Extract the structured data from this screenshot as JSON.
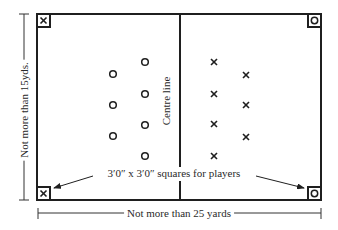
{
  "diagram": {
    "colors": {
      "line": "#1f1f1f",
      "text": "#2a2a2a",
      "background": "#ffffff"
    },
    "pitch": {
      "left": 37,
      "top": 14,
      "right": 321,
      "bottom": 200,
      "centre_x": 180
    },
    "labels": {
      "centre_line": "Centre line",
      "width_dimension": "Not more than 15yds.",
      "length_dimension": "Not more than 25 yards",
      "squares_note": "3′0″ x 3′0″ squares for players"
    },
    "corner_squares": [
      {
        "position": "top-left",
        "marker": "cross"
      },
      {
        "position": "top-right",
        "marker": "circle"
      },
      {
        "position": "bottom-left",
        "marker": "cross"
      },
      {
        "position": "bottom-right",
        "marker": "circle"
      }
    ],
    "circle_team": {
      "marker": "circle",
      "players": [
        {
          "x": 113,
          "y": 74
        },
        {
          "x": 113,
          "y": 105
        },
        {
          "x": 113,
          "y": 136
        },
        {
          "x": 145,
          "y": 62
        },
        {
          "x": 145,
          "y": 94
        },
        {
          "x": 145,
          "y": 125
        },
        {
          "x": 145,
          "y": 156
        }
      ]
    },
    "cross_team": {
      "marker": "cross",
      "players": [
        {
          "x": 214,
          "y": 62
        },
        {
          "x": 214,
          "y": 94
        },
        {
          "x": 214,
          "y": 124
        },
        {
          "x": 214,
          "y": 156
        },
        {
          "x": 246,
          "y": 75
        },
        {
          "x": 246,
          "y": 105
        },
        {
          "x": 246,
          "y": 137
        }
      ]
    }
  }
}
